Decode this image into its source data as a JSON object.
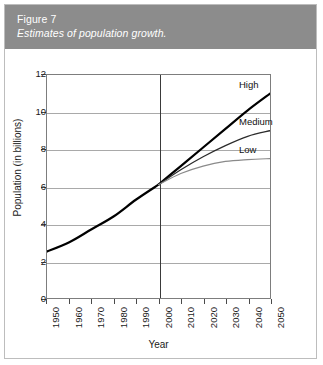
{
  "caption": {
    "figure_number": "Figure 7",
    "title": "Estimates of population growth.",
    "banner_color": "#8c8c8c",
    "text_color": "#ffffff"
  },
  "chart_data": {
    "type": "line",
    "title": "Estimates of population growth.",
    "xlabel": "Year",
    "ylabel": "Population (in billions)",
    "xlim": [
      1950,
      2050
    ],
    "ylim": [
      0,
      12
    ],
    "xticks": [
      "1950",
      "1960",
      "1970",
      "1980",
      "1990",
      "2000",
      "2010",
      "2020",
      "2030",
      "2040",
      "2050"
    ],
    "yticks": [
      "0",
      "2",
      "4",
      "6",
      "8",
      "10",
      "12"
    ],
    "grid": "horizontal",
    "legend_position": "inline-right-of-line-ends",
    "annotations": [
      {
        "text": "High",
        "x": 2050,
        "y": 11.0
      },
      {
        "text": "Medium",
        "x": 2050,
        "y": 9.0
      },
      {
        "text": "Low",
        "x": 2050,
        "y": 7.5
      }
    ],
    "divider": {
      "x": 2000,
      "label": "2000",
      "note": "historical / projection split"
    },
    "x": [
      1950,
      1960,
      1970,
      1980,
      1990,
      2000,
      2010,
      2020,
      2030,
      2040,
      2050
    ],
    "series": [
      {
        "name": "Historical",
        "color": "#000000",
        "width": 2.2,
        "values": [
          2.5,
          3.0,
          3.7,
          4.4,
          5.3,
          6.1,
          null,
          null,
          null,
          null,
          null
        ]
      },
      {
        "name": "High",
        "color": "#000000",
        "width": 2.2,
        "values": [
          null,
          null,
          null,
          null,
          null,
          6.1,
          7.1,
          8.1,
          9.1,
          10.1,
          11.0
        ]
      },
      {
        "name": "Medium",
        "color": "#2b2b2b",
        "width": 1.3,
        "values": [
          null,
          null,
          null,
          null,
          null,
          6.1,
          6.9,
          7.6,
          8.2,
          8.7,
          9.0
        ]
      },
      {
        "name": "Low",
        "color": "#8a8a8a",
        "width": 1.2,
        "values": [
          null,
          null,
          null,
          null,
          null,
          6.1,
          6.7,
          7.1,
          7.35,
          7.45,
          7.5
        ]
      }
    ]
  }
}
